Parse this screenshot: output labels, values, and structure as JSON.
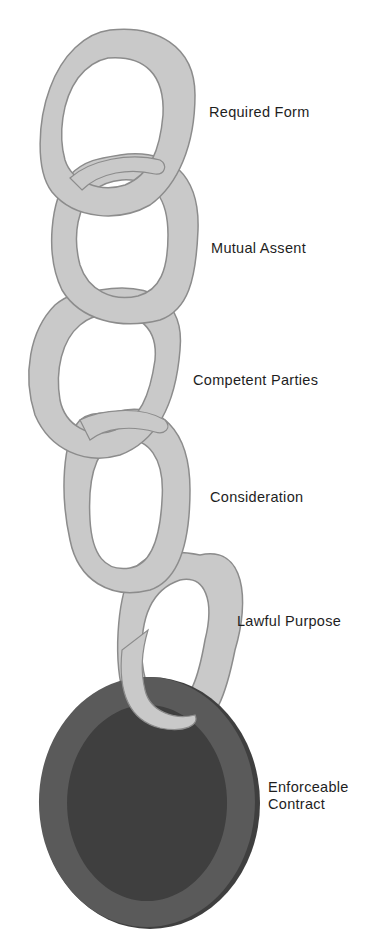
{
  "colors": {
    "link_fill": "#c9c9c9",
    "link_edge": "#8c8c8c",
    "ring_fill": "#5a5a5a",
    "ring_edge": "#3f3f3f",
    "label_color": "#1e1e1e"
  },
  "links": [
    {
      "label": "Required Form",
      "style": "link"
    },
    {
      "label": "Mutual Assent",
      "style": "link"
    },
    {
      "label": "Competent Parties",
      "style": "link"
    },
    {
      "label": "Consideration",
      "style": "link"
    },
    {
      "label": "Lawful Purpose",
      "style": "link"
    },
    {
      "label": "Enforceable\nContract",
      "style": "ring"
    }
  ]
}
